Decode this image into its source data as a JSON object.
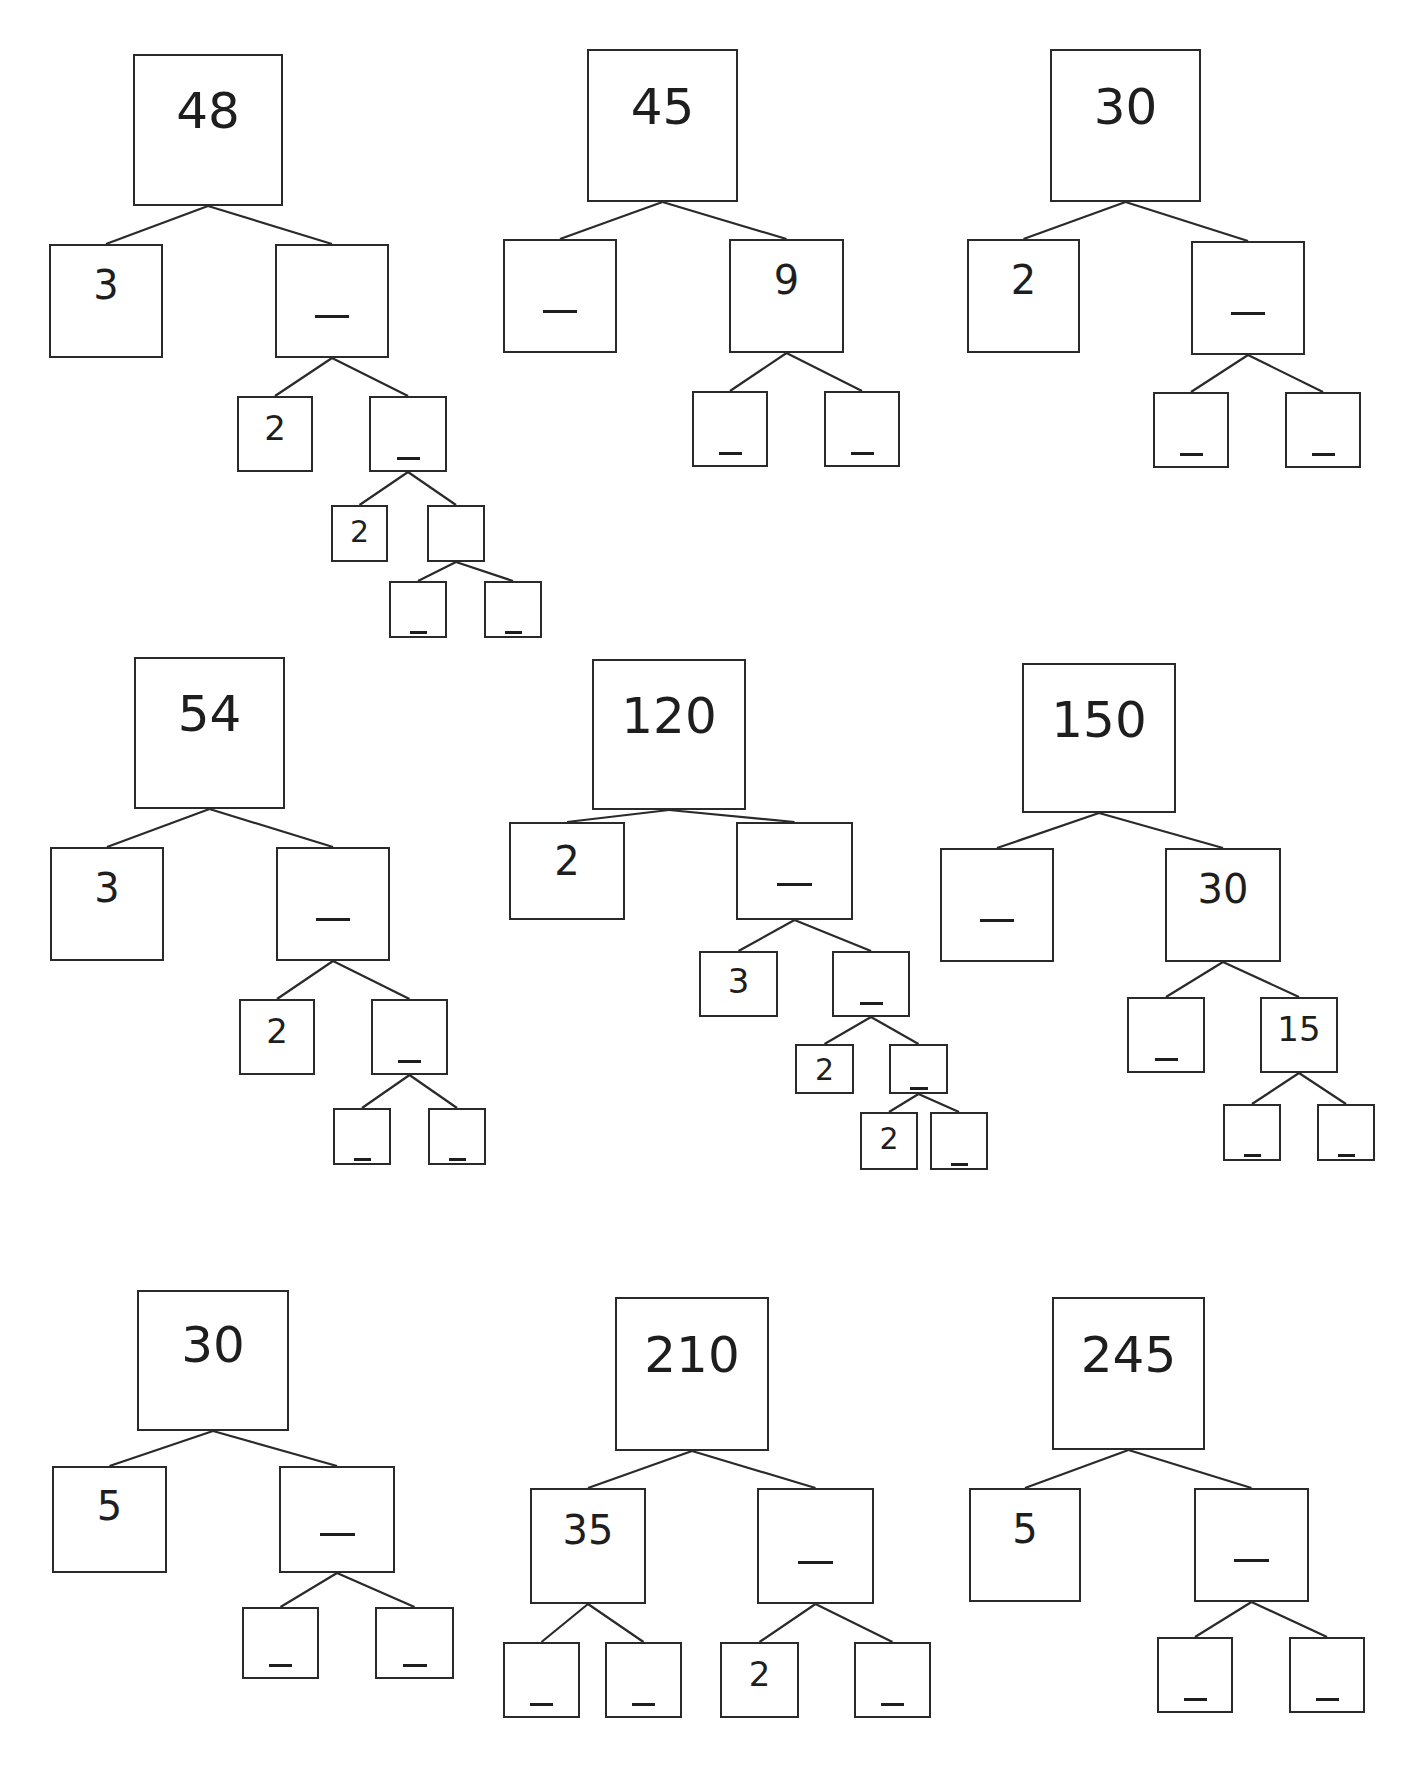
{
  "worksheet": {
    "trees": [
      {
        "id": "tree-48",
        "root": "48",
        "nodes": [
          {
            "id": "n0",
            "label": "48",
            "x": 133,
            "y": 54,
            "w": 150,
            "h": 152,
            "fs": 50,
            "parent": null
          },
          {
            "id": "n1",
            "label": "3",
            "x": 49,
            "y": 244,
            "w": 114,
            "h": 114,
            "fs": 40,
            "parent": "n0"
          },
          {
            "id": "n2",
            "label": "_",
            "x": 275,
            "y": 244,
            "w": 114,
            "h": 114,
            "fs": 40,
            "parent": "n0"
          },
          {
            "id": "n3",
            "label": "2",
            "x": 237,
            "y": 396,
            "w": 76,
            "h": 76,
            "fs": 34,
            "parent": "n2"
          },
          {
            "id": "n4",
            "label": "_",
            "x": 369,
            "y": 396,
            "w": 78,
            "h": 76,
            "fs": 34,
            "parent": "n2"
          },
          {
            "id": "n5",
            "label": "2",
            "x": 331,
            "y": 505,
            "w": 57,
            "h": 57,
            "fs": 30,
            "parent": "n4"
          },
          {
            "id": "n6",
            "label": "",
            "x": 427,
            "y": 505,
            "w": 58,
            "h": 57,
            "fs": 30,
            "parent": "n4"
          },
          {
            "id": "n7",
            "label": "_",
            "x": 389,
            "y": 581,
            "w": 58,
            "h": 57,
            "fs": 30,
            "parent": "n6"
          },
          {
            "id": "n8",
            "label": "_",
            "x": 484,
            "y": 581,
            "w": 58,
            "h": 57,
            "fs": 30,
            "parent": "n6"
          }
        ]
      },
      {
        "id": "tree-45",
        "root": "45",
        "nodes": [
          {
            "id": "n0",
            "label": "45",
            "x": 587,
            "y": 49,
            "w": 151,
            "h": 153,
            "fs": 50,
            "parent": null
          },
          {
            "id": "n1",
            "label": "_",
            "x": 503,
            "y": 239,
            "w": 114,
            "h": 114,
            "fs": 40,
            "parent": "n0"
          },
          {
            "id": "n2",
            "label": "9",
            "x": 729,
            "y": 239,
            "w": 115,
            "h": 114,
            "fs": 40,
            "parent": "n0"
          },
          {
            "id": "n3",
            "label": "_",
            "x": 692,
            "y": 391,
            "w": 76,
            "h": 76,
            "fs": 34,
            "parent": "n2"
          },
          {
            "id": "n4",
            "label": "_",
            "x": 824,
            "y": 391,
            "w": 76,
            "h": 76,
            "fs": 34,
            "parent": "n2"
          }
        ]
      },
      {
        "id": "tree-30a",
        "root": "30",
        "nodes": [
          {
            "id": "n0",
            "label": "30",
            "x": 1050,
            "y": 49,
            "w": 151,
            "h": 153,
            "fs": 50,
            "parent": null
          },
          {
            "id": "n1",
            "label": "2",
            "x": 967,
            "y": 239,
            "w": 113,
            "h": 114,
            "fs": 40,
            "parent": "n0"
          },
          {
            "id": "n2",
            "label": "_",
            "x": 1191,
            "y": 241,
            "w": 114,
            "h": 114,
            "fs": 40,
            "parent": "n0"
          },
          {
            "id": "n3",
            "label": "_",
            "x": 1153,
            "y": 392,
            "w": 76,
            "h": 76,
            "fs": 34,
            "parent": "n2"
          },
          {
            "id": "n4",
            "label": "_",
            "x": 1285,
            "y": 392,
            "w": 76,
            "h": 76,
            "fs": 34,
            "parent": "n2"
          }
        ]
      },
      {
        "id": "tree-54",
        "root": "54",
        "nodes": [
          {
            "id": "n0",
            "label": "54",
            "x": 134,
            "y": 657,
            "w": 151,
            "h": 152,
            "fs": 50,
            "parent": null
          },
          {
            "id": "n1",
            "label": "3",
            "x": 50,
            "y": 847,
            "w": 114,
            "h": 114,
            "fs": 40,
            "parent": "n0"
          },
          {
            "id": "n2",
            "label": "_",
            "x": 276,
            "y": 847,
            "w": 114,
            "h": 114,
            "fs": 40,
            "parent": "n0"
          },
          {
            "id": "n3",
            "label": "2",
            "x": 239,
            "y": 999,
            "w": 76,
            "h": 76,
            "fs": 34,
            "parent": "n2"
          },
          {
            "id": "n4",
            "label": "_",
            "x": 371,
            "y": 999,
            "w": 77,
            "h": 76,
            "fs": 34,
            "parent": "n2"
          },
          {
            "id": "n5",
            "label": "_",
            "x": 333,
            "y": 1108,
            "w": 58,
            "h": 57,
            "fs": 30,
            "parent": "n4"
          },
          {
            "id": "n6",
            "label": "_",
            "x": 428,
            "y": 1108,
            "w": 58,
            "h": 57,
            "fs": 30,
            "parent": "n4"
          }
        ]
      },
      {
        "id": "tree-120",
        "root": "120",
        "nodes": [
          {
            "id": "n0",
            "label": "120",
            "x": 592,
            "y": 659,
            "w": 154,
            "h": 151,
            "fs": 50,
            "parent": null
          },
          {
            "id": "n1",
            "label": "2",
            "x": 509,
            "y": 822,
            "w": 116,
            "h": 98,
            "fs": 40,
            "parent": "n0"
          },
          {
            "id": "n2",
            "label": "_",
            "x": 736,
            "y": 822,
            "w": 117,
            "h": 98,
            "fs": 40,
            "parent": "n0"
          },
          {
            "id": "n3",
            "label": "3",
            "x": 699,
            "y": 951,
            "w": 79,
            "h": 66,
            "fs": 34,
            "parent": "n2"
          },
          {
            "id": "n4",
            "label": "_",
            "x": 832,
            "y": 951,
            "w": 78,
            "h": 66,
            "fs": 34,
            "parent": "n2"
          },
          {
            "id": "n5",
            "label": "2",
            "x": 795,
            "y": 1044,
            "w": 59,
            "h": 50,
            "fs": 30,
            "parent": "n4"
          },
          {
            "id": "n6",
            "label": "_",
            "x": 889,
            "y": 1044,
            "w": 59,
            "h": 50,
            "fs": 30,
            "parent": "n4"
          },
          {
            "id": "n7",
            "label": "2",
            "x": 860,
            "y": 1112,
            "w": 58,
            "h": 58,
            "fs": 30,
            "parent": "n6"
          },
          {
            "id": "n8",
            "label": "_",
            "x": 930,
            "y": 1112,
            "w": 58,
            "h": 58,
            "fs": 30,
            "parent": "n6"
          }
        ]
      },
      {
        "id": "tree-150",
        "root": "150",
        "nodes": [
          {
            "id": "n0",
            "label": "150",
            "x": 1022,
            "y": 663,
            "w": 154,
            "h": 150,
            "fs": 50,
            "parent": null
          },
          {
            "id": "n1",
            "label": "_",
            "x": 940,
            "y": 848,
            "w": 114,
            "h": 114,
            "fs": 40,
            "parent": "n0"
          },
          {
            "id": "n2",
            "label": "30",
            "x": 1165,
            "y": 848,
            "w": 116,
            "h": 114,
            "fs": 40,
            "parent": "n0"
          },
          {
            "id": "n3",
            "label": "_",
            "x": 1127,
            "y": 997,
            "w": 78,
            "h": 76,
            "fs": 34,
            "parent": "n2"
          },
          {
            "id": "n4",
            "label": "15",
            "x": 1260,
            "y": 997,
            "w": 78,
            "h": 76,
            "fs": 34,
            "parent": "n2"
          },
          {
            "id": "n5",
            "label": "_",
            "x": 1223,
            "y": 1104,
            "w": 58,
            "h": 57,
            "fs": 30,
            "parent": "n4"
          },
          {
            "id": "n6",
            "label": "_",
            "x": 1317,
            "y": 1104,
            "w": 58,
            "h": 57,
            "fs": 30,
            "parent": "n4"
          }
        ]
      },
      {
        "id": "tree-30b",
        "root": "30",
        "nodes": [
          {
            "id": "n0",
            "label": "30",
            "x": 137,
            "y": 1290,
            "w": 152,
            "h": 141,
            "fs": 50,
            "parent": null
          },
          {
            "id": "n1",
            "label": "5",
            "x": 52,
            "y": 1466,
            "w": 115,
            "h": 107,
            "fs": 40,
            "parent": "n0"
          },
          {
            "id": "n2",
            "label": "_",
            "x": 279,
            "y": 1466,
            "w": 116,
            "h": 107,
            "fs": 40,
            "parent": "n0"
          },
          {
            "id": "n3",
            "label": "_",
            "x": 242,
            "y": 1607,
            "w": 77,
            "h": 72,
            "fs": 34,
            "parent": "n2"
          },
          {
            "id": "n4",
            "label": "_",
            "x": 375,
            "y": 1607,
            "w": 79,
            "h": 72,
            "fs": 34,
            "parent": "n2"
          }
        ]
      },
      {
        "id": "tree-210",
        "root": "210",
        "nodes": [
          {
            "id": "n0",
            "label": "210",
            "x": 615,
            "y": 1297,
            "w": 154,
            "h": 154,
            "fs": 50,
            "parent": null
          },
          {
            "id": "n1",
            "label": "35",
            "x": 530,
            "y": 1488,
            "w": 116,
            "h": 116,
            "fs": 40,
            "parent": "n0"
          },
          {
            "id": "n2",
            "label": "_",
            "x": 757,
            "y": 1488,
            "w": 117,
            "h": 116,
            "fs": 40,
            "parent": "n0"
          },
          {
            "id": "n3",
            "label": "_",
            "x": 503,
            "y": 1642,
            "w": 77,
            "h": 76,
            "fs": 34,
            "parent": "n1"
          },
          {
            "id": "n4",
            "label": "_",
            "x": 605,
            "y": 1642,
            "w": 77,
            "h": 76,
            "fs": 34,
            "parent": "n1"
          },
          {
            "id": "n5",
            "label": "2",
            "x": 720,
            "y": 1642,
            "w": 79,
            "h": 76,
            "fs": 34,
            "parent": "n2"
          },
          {
            "id": "n6",
            "label": "_",
            "x": 854,
            "y": 1642,
            "w": 77,
            "h": 76,
            "fs": 34,
            "parent": "n2"
          }
        ]
      },
      {
        "id": "tree-245",
        "root": "245",
        "nodes": [
          {
            "id": "n0",
            "label": "245",
            "x": 1052,
            "y": 1297,
            "w": 153,
            "h": 153,
            "fs": 50,
            "parent": null
          },
          {
            "id": "n1",
            "label": "5",
            "x": 969,
            "y": 1488,
            "w": 112,
            "h": 114,
            "fs": 40,
            "parent": "n0"
          },
          {
            "id": "n2",
            "label": "_",
            "x": 1194,
            "y": 1488,
            "w": 115,
            "h": 114,
            "fs": 40,
            "parent": "n0"
          },
          {
            "id": "n3",
            "label": "_",
            "x": 1157,
            "y": 1637,
            "w": 76,
            "h": 76,
            "fs": 34,
            "parent": "n2"
          },
          {
            "id": "n4",
            "label": "_",
            "x": 1289,
            "y": 1637,
            "w": 76,
            "h": 76,
            "fs": 34,
            "parent": "n2"
          }
        ]
      }
    ]
  },
  "colors": {
    "stroke": "#2a2a2a",
    "text": "#1e1e1e",
    "background": "#ffffff"
  }
}
